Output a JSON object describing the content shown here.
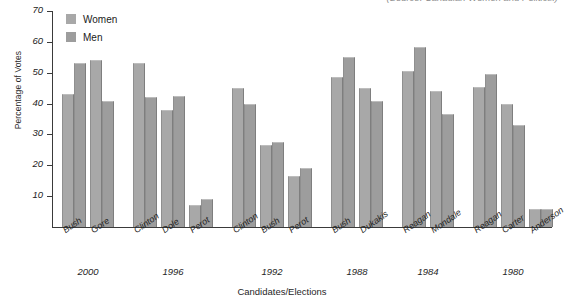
{
  "caption": {
    "clipped_text": "(Source: Canadian Women and Politics.)"
  },
  "legend": {
    "position": "top-left",
    "items": [
      {
        "label": "Women",
        "color": "#a8a8a8",
        "key": "women"
      },
      {
        "label": "Men",
        "color": "#9d9d9d",
        "key": "men"
      }
    ]
  },
  "axes": {
    "y_title": "Percentage of Votes",
    "x_title": "Candidates/Elections",
    "y_ticks": [
      10,
      20,
      30,
      40,
      50,
      60,
      70
    ]
  },
  "chart_data": {
    "type": "bar",
    "title": "",
    "subtitle": "",
    "xlabel": "Candidates/Elections",
    "ylabel": "Percentage of Votes",
    "ylim": [
      0,
      70
    ],
    "yticks": [
      10,
      20,
      30,
      40,
      50,
      60,
      70
    ],
    "grid": false,
    "legend_position": "top-left",
    "categories": [
      "Bush",
      "Gore",
      "Clinton",
      "Dole",
      "Perot",
      "Clinton",
      "Bush",
      "Perot",
      "Bush",
      "Dukakis",
      "Reagan",
      "Mondale",
      "Reagan",
      "Carter",
      "Anderson"
    ],
    "series": [
      {
        "name": "Women",
        "color": "#a8a8a8",
        "values": [
          43,
          54,
          53,
          38,
          7,
          45,
          26.5,
          16.5,
          48.5,
          45,
          50.5,
          44,
          45.5,
          40,
          6
        ]
      },
      {
        "name": "Men",
        "color": "#9d9d9d",
        "values": [
          53,
          41,
          42,
          42.5,
          9,
          40,
          27.5,
          19,
          55,
          41,
          58.5,
          36.5,
          49.5,
          33,
          6
        ]
      }
    ],
    "groups": [
      {
        "year": "2000",
        "candidates": [
          "Bush",
          "Gore"
        ]
      },
      {
        "year": "1996",
        "candidates": [
          "Clinton",
          "Dole",
          "Perot"
        ]
      },
      {
        "year": "1992",
        "candidates": [
          "Clinton",
          "Bush",
          "Perot"
        ]
      },
      {
        "year": "1988",
        "candidates": [
          "Bush",
          "Dukakis"
        ]
      },
      {
        "year": "1984",
        "candidates": [
          "Reagan",
          "Mondale"
        ]
      },
      {
        "year": "1980",
        "candidates": [
          "Reagan",
          "Carter",
          "Anderson"
        ]
      }
    ],
    "year_labels": [
      "2000",
      "1996",
      "1992",
      "1988",
      "1984",
      "1980"
    ]
  }
}
